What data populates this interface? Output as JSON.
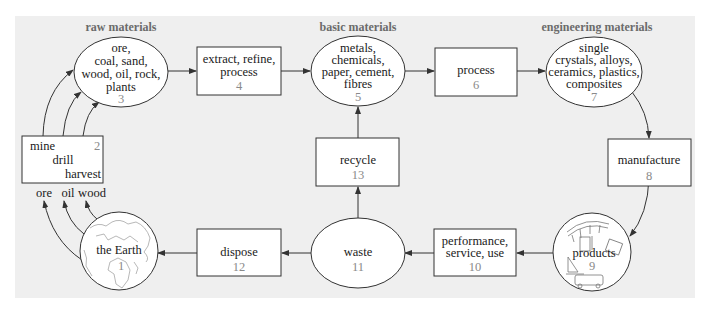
{
  "categories": {
    "raw": "raw materials",
    "basic": "basic materials",
    "engineering": "engineering materials"
  },
  "nodes": {
    "n1": {
      "lines": [
        "the Earth"
      ],
      "number": "1"
    },
    "n2": {
      "lines": [
        "mine",
        "drill",
        "harvest"
      ],
      "number": "2"
    },
    "n3": {
      "lines": [
        "ore,",
        "coal, sand,",
        "wood, oil, rock,",
        "plants"
      ],
      "number": "3"
    },
    "n4": {
      "lines": [
        "extract, refine,",
        "process"
      ],
      "number": "4"
    },
    "n5": {
      "lines": [
        "metals,",
        "chemicals,",
        "paper, cement,",
        "fibres"
      ],
      "number": "5"
    },
    "n6": {
      "lines": [
        "process"
      ],
      "number": "6"
    },
    "n7": {
      "lines": [
        "single",
        "crystals, alloys,",
        "ceramics, plastics,",
        "composites"
      ],
      "number": "7"
    },
    "n8": {
      "lines": [
        "manufacture"
      ],
      "number": "8"
    },
    "n9": {
      "lines": [
        "products"
      ],
      "number": "9"
    },
    "n10": {
      "lines": [
        "performance,",
        "service, use"
      ],
      "number": "10"
    },
    "n11": {
      "lines": [
        "waste"
      ],
      "number": "11"
    },
    "n12": {
      "lines": [
        "dispose"
      ],
      "number": "12"
    },
    "n13": {
      "lines": [
        "recycle"
      ],
      "number": "13"
    }
  },
  "earth_outputs": [
    "ore",
    "oil",
    "wood"
  ],
  "colors": {
    "panel": "#efefef",
    "stroke": "#333333",
    "category_text": "#6b6b6b",
    "number_text": "#8a8a8a"
  }
}
